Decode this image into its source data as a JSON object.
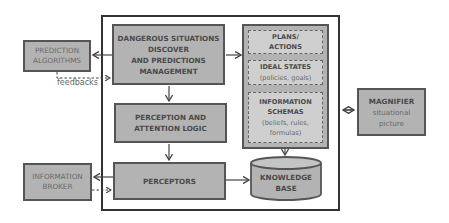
{
  "diagram": {
    "external": {
      "prediction_algorithms": [
        "PREDICTION",
        "ALGORITHMS"
      ],
      "information_broker": [
        "INFORMATION",
        "BROKER"
      ],
      "magnifier": {
        "title": "MAGNIFIER",
        "sub1": "situational",
        "sub2": "picture"
      }
    },
    "core": {
      "dangerous": [
        "DANGEROUS SITUATIONS",
        "DISCOVER",
        "AND PREDICTIONS",
        "MANAGEMENT"
      ],
      "perception": [
        "PERCEPTION AND",
        "ATTENTION LOGIC"
      ],
      "perceptors": "PERCEPTORS",
      "plans": [
        "PLANS/",
        "ACTIONS"
      ],
      "ideal": {
        "title": "IDEAL STATES",
        "sub": "(policies, goals)"
      },
      "schemas": {
        "title1": "INFORMATION",
        "title2": "SCHEMAS",
        "sub1": "(beliefs, rules,",
        "sub2": "formulas)"
      },
      "knowledge_base": [
        "KNOWLEDGE",
        "BASE"
      ]
    },
    "edge_labels": {
      "feedbacks": "feedbacks"
    },
    "colors": {
      "box_fill": "#b3b3b3",
      "inner_fill": "#cfcfcf",
      "border": "#555555",
      "frame": "#333333"
    }
  }
}
